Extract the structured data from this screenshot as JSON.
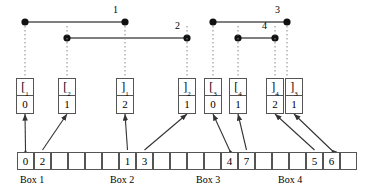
{
  "figure": {
    "colors": {
      "stroke": "#555555",
      "dot": "#111111",
      "dotted": "#888888",
      "text": "#000000",
      "background": "#ffffff"
    }
  },
  "intervals": [
    {
      "label": "1",
      "left_x": 25,
      "right_x": 125,
      "y": 22,
      "label_x": 113,
      "label_y": 4
    },
    {
      "label": "2",
      "left_x": 67,
      "right_x": 187,
      "y": 38,
      "label_x": 175,
      "label_y": 20
    },
    {
      "label": "3",
      "left_x": 213,
      "right_x": 287,
      "y": 22,
      "label_x": 275,
      "label_y": 4
    },
    {
      "label": "4",
      "left_x": 238,
      "right_x": 275,
      "y": 38,
      "label_x": 262,
      "label_y": 20
    }
  ],
  "nodes": [
    {
      "id": "n1",
      "symbol": "[",
      "subscript": "1",
      "value": "0",
      "x": 16,
      "y": 78,
      "anchor_x": 25
    },
    {
      "id": "n2",
      "symbol": "[",
      "subscript": "2",
      "value": "1",
      "x": 58,
      "y": 78,
      "anchor_x": 67
    },
    {
      "id": "n3",
      "symbol": "]",
      "subscript": "1",
      "value": "2",
      "x": 116,
      "y": 78,
      "anchor_x": 125
    },
    {
      "id": "n4",
      "symbol": "]",
      "subscript": "2",
      "value": "1",
      "x": 178,
      "y": 78,
      "anchor_x": 187
    },
    {
      "id": "n5",
      "symbol": "[",
      "subscript": "3",
      "value": "0",
      "x": 204,
      "y": 78,
      "anchor_x": 213
    },
    {
      "id": "n6",
      "symbol": "[",
      "subscript": "4",
      "value": "1",
      "x": 229,
      "y": 78,
      "anchor_x": 238
    },
    {
      "id": "n7",
      "symbol": "]",
      "subscript": "4",
      "value": "2",
      "x": 266,
      "y": 78,
      "anchor_x": 275
    },
    {
      "id": "n8",
      "symbol": "]",
      "subscript": "3",
      "value": "1",
      "x": 285,
      "y": 78,
      "anchor_x": 287
    }
  ],
  "array": {
    "cell_count": 20,
    "start_x": 17,
    "cell_width": 17,
    "cells": [
      {
        "index": 0,
        "value": "0"
      },
      {
        "index": 1,
        "value": "2"
      },
      {
        "index": 2,
        "value": ""
      },
      {
        "index": 3,
        "value": ""
      },
      {
        "index": 4,
        "value": ""
      },
      {
        "index": 5,
        "value": ""
      },
      {
        "index": 6,
        "value": "1"
      },
      {
        "index": 7,
        "value": "3"
      },
      {
        "index": 8,
        "value": ""
      },
      {
        "index": 9,
        "value": ""
      },
      {
        "index": 10,
        "value": ""
      },
      {
        "index": 11,
        "value": ""
      },
      {
        "index": 12,
        "value": "4"
      },
      {
        "index": 13,
        "value": "7"
      },
      {
        "index": 14,
        "value": ""
      },
      {
        "index": 15,
        "value": ""
      },
      {
        "index": 16,
        "value": ""
      },
      {
        "index": 17,
        "value": "5"
      },
      {
        "index": 18,
        "value": "6"
      },
      {
        "index": 19,
        "value": ""
      }
    ]
  },
  "box_labels": [
    {
      "text": "Box 1",
      "x": 20
    },
    {
      "text": "Box 2",
      "x": 110
    },
    {
      "text": "Box 3",
      "x": 196
    },
    {
      "text": "Box 4",
      "x": 278
    }
  ],
  "connections": [
    {
      "from_node": "n1",
      "to_cell": 0,
      "double": true
    },
    {
      "from_node": "n2",
      "to_cell": 1,
      "double": false
    },
    {
      "from_node": "n3",
      "to_cell": 6,
      "double": false
    },
    {
      "from_node": "n4",
      "to_cell": 7,
      "double": false
    },
    {
      "from_node": "n5",
      "to_cell": 12,
      "double": true
    },
    {
      "from_node": "n6",
      "to_cell": 13,
      "double": false
    },
    {
      "from_node": "n7",
      "to_cell": 17,
      "double": false
    },
    {
      "from_node": "n8",
      "to_cell": 18,
      "double": true
    }
  ]
}
